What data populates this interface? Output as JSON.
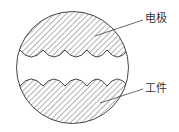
{
  "diagram": {
    "labels": {
      "electrode": "电极",
      "workpiece": "工件"
    },
    "colors": {
      "line": "#444444",
      "hatch": "#555555",
      "background": "#ffffff"
    }
  }
}
